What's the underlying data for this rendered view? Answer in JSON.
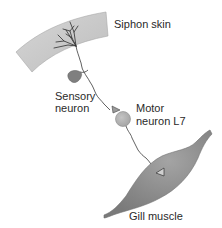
{
  "diagram": {
    "title": "",
    "labels": {
      "siphon_skin": "Siphon skin",
      "sensory_neuron_line1": "Sensory",
      "sensory_neuron_line2": "neuron",
      "motor_neuron_line1": "Motor",
      "motor_neuron_line2": "neuron L7",
      "gill_muscle": "Gill muscle"
    },
    "colors": {
      "skin_fill": "#c8c8c8",
      "skin_edge": "#9a9a9a",
      "sensory_soma": "#7d7d7d",
      "motor_soma": "#b3b3b3",
      "muscle_fill": "#8e8e8e",
      "muscle_highlight": "#bdbdbd",
      "axon": "#3a3a3a",
      "text": "#2a2a2a"
    }
  }
}
